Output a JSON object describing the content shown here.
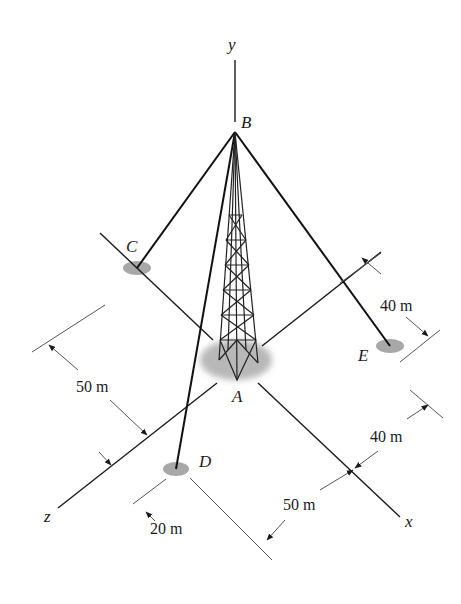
{
  "figure": {
    "points": {
      "A": {
        "label": "A"
      },
      "B": {
        "label": "B"
      },
      "C": {
        "label": "C"
      },
      "D": {
        "label": "D"
      },
      "E": {
        "label": "E"
      }
    },
    "axes": {
      "x": {
        "label": "x"
      },
      "y": {
        "label": "y"
      },
      "z": {
        "label": "z"
      }
    },
    "dimensions": [
      {
        "id": "dim-40m-top-right",
        "label": "40 m"
      },
      {
        "id": "dim-40m-bottom-right",
        "label": "40 m"
      },
      {
        "id": "dim-50m-left",
        "label": "50 m"
      },
      {
        "id": "dim-50m-bottom",
        "label": "50 m"
      },
      {
        "id": "dim-20m",
        "label": "20 m"
      }
    ],
    "colors": {
      "line": "#1a1a1a",
      "dim_line": "#555555",
      "anchor_fill": "#a8a8a8",
      "base_shadow": "#b5b5b5"
    }
  }
}
